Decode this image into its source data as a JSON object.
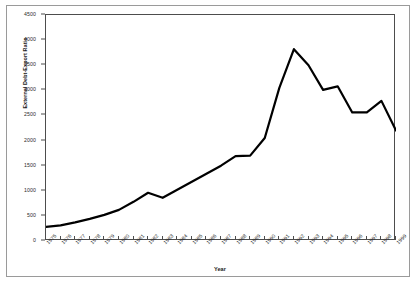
{
  "chart_data": {
    "type": "line",
    "title": "",
    "xlabel": "Year",
    "ylabel": "External Debt-Export Ratio",
    "grid": false,
    "legend": "none",
    "xlim": [
      1975,
      1999
    ],
    "ylim": [
      0,
      4500
    ],
    "ytick_labels": [
      "0",
      "500",
      "1000",
      "1500",
      "2000",
      "2500",
      "3000",
      "3500",
      "4000",
      "4500"
    ],
    "ytick_values": [
      0,
      500,
      1000,
      1500,
      2000,
      2500,
      3000,
      3500,
      4000,
      4500
    ],
    "categories": [
      "1975",
      "1976",
      "1977",
      "1978",
      "1979",
      "1980",
      "1981",
      "1982",
      "1983",
      "1984",
      "1985",
      "1986",
      "1987",
      "1988",
      "1989",
      "1990",
      "1991",
      "1992",
      "1993",
      "1994",
      "1995",
      "1996",
      "1997",
      "1998",
      "1999"
    ],
    "series": [
      {
        "name": "External Debt-Export Ratio",
        "color": "#000000",
        "values": [
          280,
          310,
          370,
          440,
          520,
          620,
          780,
          960,
          860,
          1020,
          1180,
          1340,
          1500,
          1690,
          1700,
          2050,
          3050,
          3820,
          3500,
          3010,
          3080,
          2560,
          2560,
          2790,
          2200
        ]
      }
    ]
  }
}
